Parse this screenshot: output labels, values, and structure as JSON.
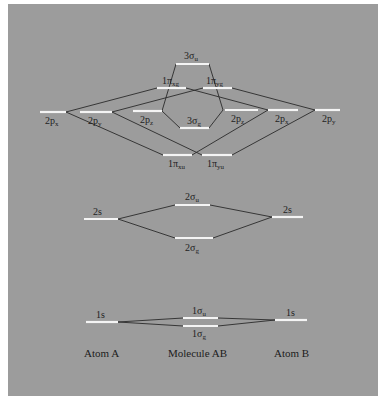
{
  "figure": {
    "colors": {
      "background": "#9c9c9c",
      "level": "#f4f4f4",
      "line": "#2a2a2a",
      "text": "#1e1e1e"
    },
    "captions": {
      "atom_a": "Atom A",
      "molecule": "Molecule AB",
      "atom_b": "Atom B"
    },
    "levels": {
      "sigma_u_3": {
        "main": "3σ",
        "sub": "u"
      },
      "pi_xg_1": {
        "main": "1π",
        "sub": "xg"
      },
      "pi_yg_1": {
        "main": "1π",
        "sub": "yg"
      },
      "sigma_g_3": {
        "main": "3σ",
        "sub": "g"
      },
      "pi_xu_1": {
        "main": "1π",
        "sub": "xu"
      },
      "pi_yu_1": {
        "main": "1π",
        "sub": "yu"
      },
      "a_2px": {
        "main": "2p",
        "sub": "x"
      },
      "a_2py": {
        "main": "2p",
        "sub": "y"
      },
      "a_2pz": {
        "main": "2p",
        "sub": "z"
      },
      "b_2pz": {
        "main": "2p",
        "sub": "z"
      },
      "b_2px": {
        "main": "2p",
        "sub": "x"
      },
      "b_2py": {
        "main": "2p",
        "sub": "y"
      },
      "a_2s": {
        "main": "2s"
      },
      "b_2s": {
        "main": "2s"
      },
      "sigma_u_2": {
        "main": "2σ",
        "sub": "u"
      },
      "sigma_g_2": {
        "main": "2σ",
        "sub": "g"
      },
      "a_1s": {
        "main": "1s"
      },
      "b_1s": {
        "main": "1s"
      },
      "sigma_u_1": {
        "main": "1σ",
        "sub": "u"
      },
      "sigma_g_1": {
        "main": "1σ",
        "sub": "g"
      }
    }
  }
}
